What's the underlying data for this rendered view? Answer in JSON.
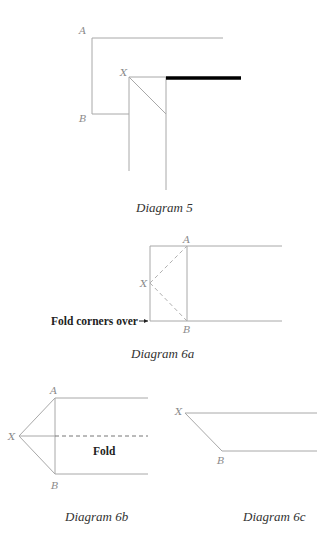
{
  "diagrams": [
    {
      "id": "5",
      "caption": "Diagram 5",
      "labels": {
        "a": "A",
        "b": "B",
        "x": "X"
      }
    },
    {
      "id": "6a",
      "caption": "Diagram 6a",
      "labels": {
        "a": "A",
        "b": "B",
        "x": "X"
      },
      "annotation": "Fold corners over"
    },
    {
      "id": "6b",
      "caption": "Diagram 6b",
      "labels": {
        "a": "A",
        "b": "B",
        "x": "X"
      },
      "annotation": "Fold"
    },
    {
      "id": "6c",
      "caption": "Diagram 6c",
      "labels": {
        "b": "B",
        "x": "X"
      }
    }
  ],
  "colors": {
    "line": "#a8a8a8",
    "thick_line": "#000000",
    "caption_text": "#333333"
  }
}
